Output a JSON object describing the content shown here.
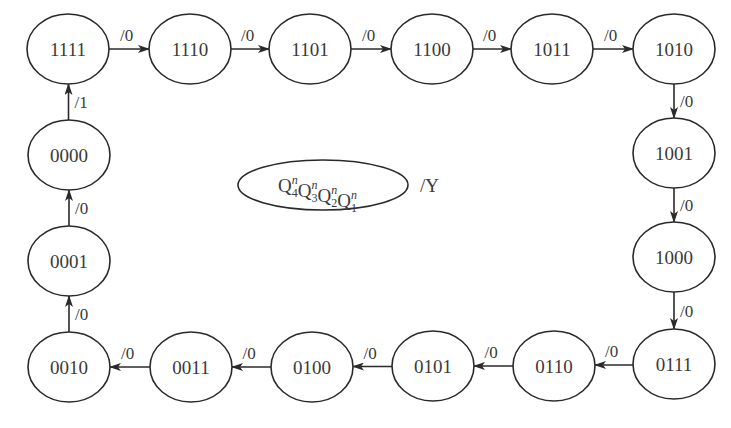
{
  "diagram": {
    "type": "state-transition-diagram",
    "states": [
      {
        "id": "s1111",
        "label": "1111",
        "cx": 68,
        "cy": 49
      },
      {
        "id": "s1110",
        "label": "1110",
        "cx": 190,
        "cy": 49
      },
      {
        "id": "s1101",
        "label": "1101",
        "cx": 310,
        "cy": 49
      },
      {
        "id": "s1100",
        "label": "1100",
        "cx": 432,
        "cy": 49
      },
      {
        "id": "s1011",
        "label": "1011",
        "cx": 552,
        "cy": 49
      },
      {
        "id": "s1010",
        "label": "1010",
        "cx": 674,
        "cy": 49
      },
      {
        "id": "s1001",
        "label": "1001",
        "cx": 674,
        "cy": 153
      },
      {
        "id": "s1000",
        "label": "1000",
        "cx": 674,
        "cy": 257
      },
      {
        "id": "s0111",
        "label": "0111",
        "cx": 674,
        "cy": 364
      },
      {
        "id": "s0110",
        "label": "0110",
        "cx": 554,
        "cy": 366
      },
      {
        "id": "s0101",
        "label": "0101",
        "cx": 433,
        "cy": 366
      },
      {
        "id": "s0100",
        "label": "0100",
        "cx": 312,
        "cy": 367
      },
      {
        "id": "s0011",
        "label": "0011",
        "cx": 191,
        "cy": 367
      },
      {
        "id": "s0010",
        "label": "0010",
        "cx": 69,
        "cy": 367
      },
      {
        "id": "s0001",
        "label": "0001",
        "cx": 69,
        "cy": 261
      },
      {
        "id": "s0000",
        "label": "0000",
        "cx": 69,
        "cy": 155
      }
    ],
    "transitions": [
      {
        "from": "1111",
        "to": "1110",
        "label": "/0"
      },
      {
        "from": "1110",
        "to": "1101",
        "label": "/0"
      },
      {
        "from": "1101",
        "to": "1100",
        "label": "/0"
      },
      {
        "from": "1100",
        "to": "1011",
        "label": "/0"
      },
      {
        "from": "1011",
        "to": "1010",
        "label": "/0"
      },
      {
        "from": "1010",
        "to": "1001",
        "label": "/0"
      },
      {
        "from": "1001",
        "to": "1000",
        "label": "/0"
      },
      {
        "from": "1000",
        "to": "0111",
        "label": "/0"
      },
      {
        "from": "0111",
        "to": "0110",
        "label": "/0"
      },
      {
        "from": "0110",
        "to": "0101",
        "label": "/0"
      },
      {
        "from": "0101",
        "to": "0100",
        "label": "/0"
      },
      {
        "from": "0100",
        "to": "0011",
        "label": "/0"
      },
      {
        "from": "0011",
        "to": "0010",
        "label": "/0"
      },
      {
        "from": "0010",
        "to": "0001",
        "label": "/0"
      },
      {
        "from": "0001",
        "to": "0000",
        "label": "/0"
      },
      {
        "from": "0000",
        "to": "1111",
        "label": "/1"
      }
    ],
    "legend": {
      "state_symbol": "Q",
      "bits": [
        {
          "sub": "4",
          "sup": "n"
        },
        {
          "sub": "3",
          "sup": "n"
        },
        {
          "sub": "2",
          "sup": "n"
        },
        {
          "sub": "1",
          "sup": "n"
        }
      ],
      "output_label": "/Y"
    },
    "caption": "(caption text cut off at bottom edge — illegible)"
  },
  "colors": {
    "stroke": "#2a2a2a",
    "text": "#3a3a3a",
    "background": "#ffffff"
  }
}
